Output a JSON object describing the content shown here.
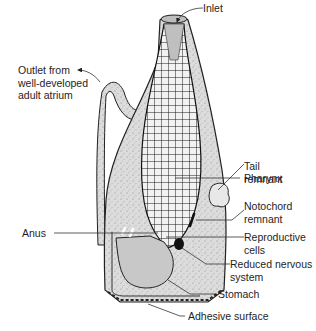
{
  "diagram": {
    "labels": {
      "inlet": "Inlet",
      "outlet": "Outlet from\nwell-developed\nadult atrium",
      "pharynx": "Pharynx",
      "tail_remnant": "Tail\nremnant",
      "notochord_remnant": "Notochord\nremnant",
      "anus": "Anus",
      "reproductive_cells": "Reproductive\ncells",
      "reduced_nervous_system": "Reduced nervous\nsystem",
      "stomach": "Stomach",
      "adhesive_surface": "Adhesive surface"
    },
    "colors": {
      "tunic_fill": "#d9d9d9",
      "gut_fill": "#c4c4c4",
      "outline": "#222222",
      "pharynx_mesh": "#1a1a1a",
      "leader_line": "#333333"
    }
  }
}
